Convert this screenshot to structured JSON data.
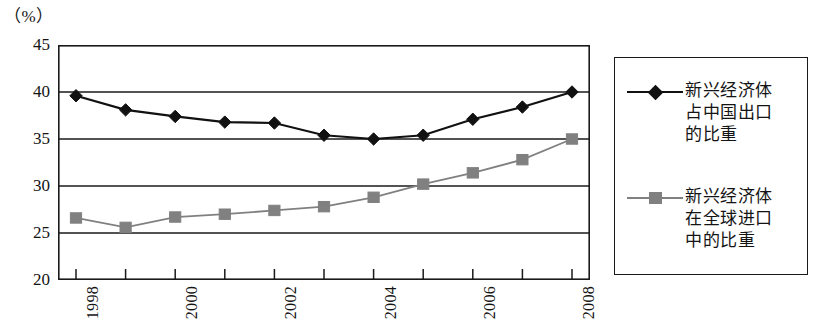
{
  "unit_label": "（%）",
  "colors": {
    "series1": "#111111",
    "series2": "#808080",
    "axis": "#1a1a1a",
    "background": "#ffffff"
  },
  "legend": {
    "position": "right",
    "entries": [
      {
        "marker": "diamond-marker",
        "color": "#111111",
        "label": "新兴经济体\n占中国出口\n的比重"
      },
      {
        "marker": "square-marker",
        "color": "#808080",
        "label": "新兴经济体\n在全球进口\n中的比重"
      }
    ]
  },
  "chart_data": {
    "type": "line",
    "title": "",
    "subtitle": "",
    "xlabel": "",
    "ylabel": "",
    "unit": "%",
    "grid": true,
    "legend_position": "right",
    "ylim": [
      20,
      45
    ],
    "yticks": [
      20,
      25,
      30,
      35,
      40,
      45
    ],
    "ytick_labels": [
      "20",
      "25",
      "30",
      "35",
      "40",
      "45"
    ],
    "x": [
      1998,
      1999,
      2000,
      2001,
      2002,
      2003,
      2004,
      2005,
      2006,
      2007,
      2008
    ],
    "xtick_labels": [
      "1998",
      "",
      "2000",
      "",
      "2002",
      "",
      "2004",
      "",
      "2006",
      "",
      "2008"
    ],
    "xtick_labels_shown": [
      "1998",
      "2000",
      "2002",
      "2004",
      "2006",
      "2008"
    ],
    "xtick_rotation": 90,
    "series": [
      {
        "name": "新兴经济体占中国出口的比重",
        "color": "#111111",
        "marker": "diamond",
        "values": [
          39.6,
          38.1,
          37.4,
          36.8,
          36.7,
          35.4,
          35.0,
          35.4,
          37.1,
          38.4,
          40.0
        ]
      },
      {
        "name": "新兴经济体在全球进口中的比重",
        "color": "#808080",
        "marker": "square",
        "values": [
          26.6,
          25.6,
          26.7,
          27.0,
          27.4,
          27.8,
          28.8,
          30.2,
          31.4,
          32.8,
          35.0
        ]
      }
    ]
  }
}
